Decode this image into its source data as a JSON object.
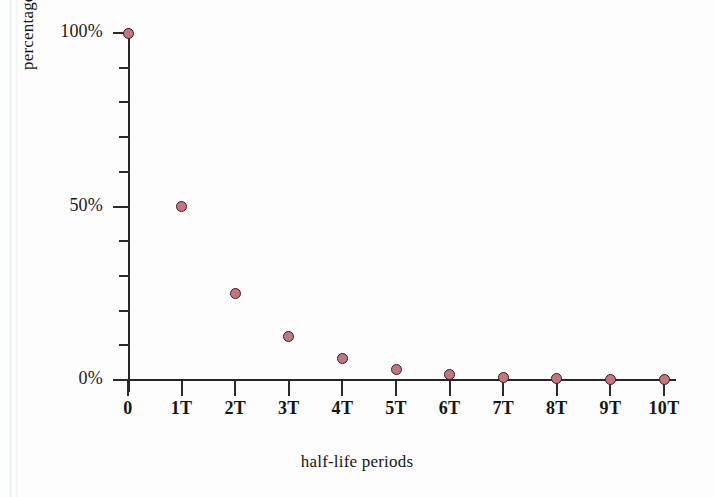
{
  "figure": {
    "name": "radioactive-decay-half-life-chart",
    "background_color": "#fdfdfd",
    "marker_fill_color": "#c4767e",
    "marker_edge_color": "#3d1d21",
    "axis_color": "#262626"
  },
  "chart_data": {
    "type": "scatter",
    "title": "",
    "xlabel": "half-life periods",
    "ylabel": "percentage of undecayed atomic nuclei",
    "categories": [
      "0",
      "1T",
      "2T",
      "3T",
      "4T",
      "5T",
      "6T",
      "7T",
      "8T",
      "9T",
      "10T"
    ],
    "x": [
      0,
      1,
      2,
      3,
      4,
      5,
      6,
      7,
      8,
      9,
      10
    ],
    "values": [
      100,
      50,
      25,
      12.5,
      6.25,
      3.125,
      1.5625,
      0.78125,
      0.390625,
      0.1953125,
      0.09765625
    ],
    "value_labels": [
      "100%",
      "50%",
      "25%",
      "12.5%",
      "6.25%",
      "3.13%",
      "1.56%",
      "0.78%",
      "0.39%",
      "0.20%",
      "0.10%"
    ],
    "xlim": [
      0,
      10
    ],
    "ylim": [
      0,
      100
    ],
    "grid": false,
    "legend": null,
    "y_tick_labels": [
      "0%",
      "50%",
      "100%"
    ],
    "y_tick_values": [
      0,
      10,
      20,
      30,
      40,
      50,
      60,
      70,
      80,
      90,
      100
    ],
    "y_major_ticks": [
      0,
      50,
      100
    ],
    "x_tick_labels": [
      "0",
      "1T",
      "2T",
      "3T",
      "4T",
      "5T",
      "6T",
      "7T",
      "8T",
      "9T",
      "10T"
    ]
  },
  "axes": {
    "y_title": "percentage of undecayed atomic nuclei",
    "x_title": "half-life periods"
  }
}
